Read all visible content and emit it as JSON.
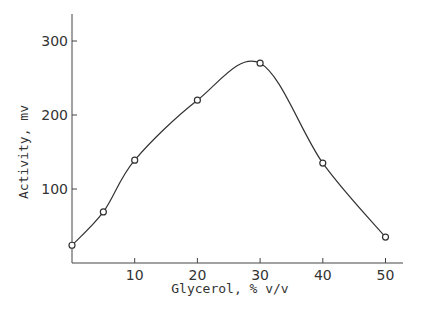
{
  "chart_data": {
    "type": "line",
    "title": "",
    "xlabel": "Glycerol, % v/v",
    "ylabel": "Activity, mv",
    "x": [
      0,
      5,
      10,
      20,
      30,
      40,
      50
    ],
    "series": [
      {
        "name": "Activity",
        "values": [
          24,
          69,
          139,
          220,
          270,
          135,
          35
        ],
        "marker": "open-circle",
        "smooth": true
      }
    ],
    "xticks": [
      10,
      20,
      30,
      40,
      50
    ],
    "yticks": [
      100,
      200,
      300
    ],
    "xlim": [
      0,
      53
    ],
    "ylim": [
      0,
      330
    ],
    "grid": false,
    "legend": null
  },
  "colors": {
    "line": "#333333",
    "axis": "#444444",
    "text": "#333333"
  }
}
